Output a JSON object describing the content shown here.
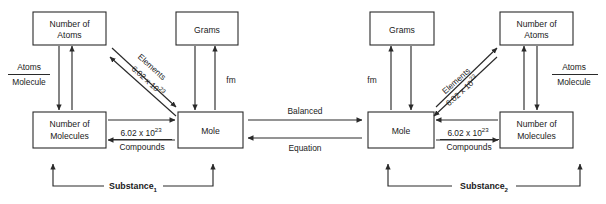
{
  "diagram": {
    "colors": {
      "stroke": "#2a2a2a",
      "background": "#ffffff",
      "text": "#1a1a1a"
    },
    "panels": [
      {
        "id": "substance-1",
        "footer_label": "Substance",
        "footer_subscript": "1",
        "boxes": {
          "number_of_atoms": "Number of\nAtoms",
          "number_of_atoms_line1": "Number of",
          "number_of_atoms_line2": "Atoms",
          "grams": "Grams",
          "number_of_molecules_line1": "Number of",
          "number_of_molecules_line2": "Molecules",
          "mole": "Mole"
        },
        "edge_labels": {
          "atoms_per_molecule_numerator": "Atoms",
          "atoms_per_molecule_denominator": "Molecule",
          "formula_mass": "fm",
          "diagonal_elements": "Elements",
          "diagonal_avogadro_base": "6.02 x 10",
          "diagonal_avogadro_exp": "23",
          "compounds_numerator_base": "6.02 x 10",
          "compounds_numerator_exp": "23",
          "compounds_denominator": "Compounds"
        }
      },
      {
        "id": "substance-2",
        "footer_label": "Substance",
        "footer_subscript": "2",
        "boxes": {
          "grams": "Grams",
          "number_of_atoms_line1": "Number of",
          "number_of_atoms_line2": "Atoms",
          "mole": "Mole",
          "number_of_molecules_line1": "Number of",
          "number_of_molecules_line2": "Molecules"
        },
        "edge_labels": {
          "atoms_per_molecule_numerator": "Atoms",
          "atoms_per_molecule_denominator": "Molecule",
          "formula_mass": "fm",
          "diagonal_elements": "Elements",
          "diagonal_avogadro_base": "6.02 x 10",
          "diagonal_avogadro_exp": "23",
          "compounds_numerator_base": "6.02 x 10",
          "compounds_numerator_exp": "23",
          "compounds_denominator": "Compounds"
        }
      }
    ],
    "center_link": {
      "top_label": "Balanced",
      "bottom_label": "Equation"
    }
  }
}
